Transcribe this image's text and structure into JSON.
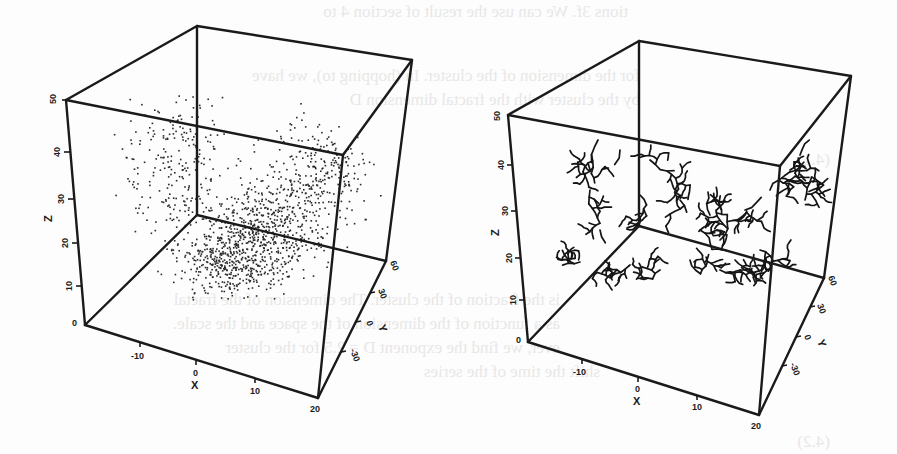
{
  "bleed_text": [
    {
      "text": "tions 3f. We can use the result of section 4 to",
      "x": 628,
      "y": 2
    },
    {
      "text": "for the dimension of the cluster. In (hopping to), we have",
      "x": 640,
      "y": 66
    },
    {
      "text": "by the cluster with the fractal dimension D",
      "x": 640,
      "y": 90
    },
    {
      "text": "(4.1)",
      "x": 830,
      "y": 150
    },
    {
      "text": "is the fraction of the cluster. The dimension of the fractal",
      "x": 560,
      "y": 290
    },
    {
      "text": "as a function of the dimension of the space and the scale.",
      "x": 560,
      "y": 314
    },
    {
      "text": "ever, we find the exponent D = 2.5 for the cluster",
      "x": 560,
      "y": 338
    },
    {
      "text": "shift the time of the series",
      "x": 600,
      "y": 362
    },
    {
      "text": "(4.2)",
      "x": 830,
      "y": 432
    }
  ],
  "chart_data": [
    {
      "type": "scatter3d",
      "title": "",
      "description": "3D scatter of random points (dense cluster elongated along x), drawn inside a perspective box",
      "axes": {
        "x": {
          "label": "X",
          "ticks": [
            -10,
            0,
            10,
            20
          ],
          "range": [
            -20,
            20
          ]
        },
        "y": {
          "label": "Y",
          "ticks": [
            -30,
            0,
            30,
            60
          ],
          "range": [
            -30,
            60
          ]
        },
        "z": {
          "label": "Z",
          "ticks": [
            0,
            10,
            20,
            30,
            40,
            50
          ],
          "range": [
            0,
            50
          ]
        }
      },
      "point_count": 1400,
      "grid": false,
      "legend": null
    },
    {
      "type": "tree3d",
      "title": "",
      "description": "3D branching (diffusion-limited aggregation style) clusters drawn inside a perspective box",
      "axes": {
        "x": {
          "label": "X",
          "ticks": [
            -10,
            0,
            10,
            20
          ],
          "range": [
            -20,
            20
          ]
        },
        "y": {
          "label": "Y",
          "ticks": [
            -30,
            0,
            30,
            60
          ],
          "range": [
            -30,
            60
          ]
        },
        "z": {
          "label": "Z",
          "ticks": [
            0,
            10,
            20,
            30,
            40,
            50
          ],
          "range": [
            0,
            50
          ]
        }
      },
      "grid": false,
      "legend": null
    }
  ],
  "plots": {
    "left": {
      "x_axis_label": "X",
      "y_axis_label": "Y",
      "z_axis_label": "Z",
      "x_ticks": [
        "-10",
        "0",
        "10",
        "20"
      ],
      "y_ticks": [
        "60",
        "30",
        "0",
        "-30"
      ],
      "z_ticks": [
        "0",
        "10",
        "20",
        "30",
        "40",
        "50"
      ]
    },
    "right": {
      "x_axis_label": "X",
      "y_axis_label": "Y",
      "z_axis_label": "Z",
      "x_ticks": [
        "-10",
        "0",
        "10",
        "20"
      ],
      "y_ticks": [
        "60",
        "30",
        "0",
        "-30"
      ],
      "z_ticks": [
        "0",
        "10",
        "20",
        "30",
        "40",
        "50"
      ]
    }
  }
}
